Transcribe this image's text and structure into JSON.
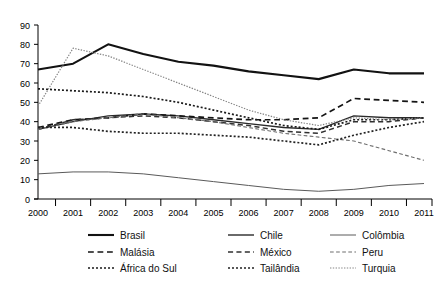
{
  "chart_data": {
    "type": "line",
    "title": "",
    "xlabel": "",
    "ylabel": "",
    "x": [
      2000,
      2001,
      2002,
      2003,
      2004,
      2005,
      2006,
      2007,
      2008,
      2009,
      2010,
      2011
    ],
    "categories": [
      "2000",
      "2001",
      "2002",
      "2003",
      "2004",
      "2005",
      "2006",
      "2007",
      "2008",
      "2009",
      "2010",
      "2011"
    ],
    "ylim": [
      0,
      90
    ],
    "yticks": [
      0,
      10,
      20,
      30,
      40,
      50,
      60,
      70,
      80,
      90
    ],
    "ytick_labels": [
      "0",
      "10",
      "20",
      "30",
      "40",
      "50",
      "60",
      "70",
      "80",
      "90"
    ],
    "grid": false,
    "legend_position": "bottom",
    "series": [
      {
        "name": "Brasil",
        "style": "solid",
        "width": 2.1,
        "color": "#121212",
        "values": [
          67,
          70,
          80,
          75,
          71,
          69,
          66,
          64,
          62,
          67,
          65,
          65
        ]
      },
      {
        "name": "Chile",
        "style": "solid",
        "width": 1.4,
        "color": "#2a2a2a",
        "values": [
          36,
          40,
          43,
          44,
          43,
          41,
          39,
          37,
          36,
          43,
          42,
          42
        ]
      },
      {
        "name": "Colômbia",
        "style": "solid",
        "width": 1.0,
        "color": "#5a5a5a",
        "values": [
          13,
          14,
          14,
          13,
          11,
          9,
          7,
          5,
          4,
          5,
          7,
          8
        ]
      },
      {
        "name": "Malásia",
        "style": "dashed",
        "width": 1.7,
        "color": "#141414",
        "values": [
          37,
          41,
          42,
          44,
          43,
          42,
          41,
          41,
          42,
          52,
          51,
          50
        ]
      },
      {
        "name": "México",
        "style": "dashed",
        "width": 1.5,
        "color": "#303030",
        "values": [
          36,
          41,
          42,
          43,
          42,
          40,
          38,
          35,
          34,
          40,
          40,
          42
        ]
      },
      {
        "name": "Peru",
        "style": "dashed",
        "width": 1.1,
        "color": "#6e6e6e",
        "values": [
          36,
          40,
          42,
          44,
          42,
          40,
          37,
          34,
          32,
          30,
          25,
          20
        ]
      },
      {
        "name": "África do Sul",
        "style": "dotted",
        "width": 1.7,
        "color": "#1a1a1a",
        "values": [
          57,
          56,
          55,
          53,
          50,
          46,
          42,
          38,
          36,
          41,
          41,
          42
        ]
      },
      {
        "name": "Tailândia",
        "style": "dotted",
        "width": 1.7,
        "color": "#222222",
        "values": [
          37,
          37,
          35,
          34,
          34,
          33,
          32,
          30,
          28,
          33,
          37,
          40
        ]
      },
      {
        "name": "Turquia",
        "style": "dotted",
        "width": 1.2,
        "color": "#858585",
        "values": [
          48,
          78,
          74,
          67,
          60,
          53,
          46,
          41,
          38,
          42,
          41,
          42
        ]
      }
    ]
  },
  "axis": {
    "y_labels": [
      "90",
      "80",
      "70",
      "60",
      "50",
      "40",
      "30",
      "20",
      "10",
      "0"
    ],
    "x_labels": [
      "2000",
      "2001",
      "2002",
      "2003",
      "2004",
      "2005",
      "2006",
      "2007",
      "2008",
      "2009",
      "2010",
      "2011"
    ]
  },
  "legend": {
    "rows": [
      [
        {
          "label": "Brasil",
          "style": "solid",
          "width": 2.1,
          "color": "#121212"
        },
        {
          "label": "Chile",
          "style": "solid",
          "width": 1.4,
          "color": "#2a2a2a"
        },
        {
          "label": "Colômbia",
          "style": "solid",
          "width": 1.0,
          "color": "#5a5a5a"
        }
      ],
      [
        {
          "label": "Malásia",
          "style": "dashed",
          "width": 1.7,
          "color": "#141414"
        },
        {
          "label": "México",
          "style": "dashed",
          "width": 1.5,
          "color": "#303030"
        },
        {
          "label": "Peru",
          "style": "dashed",
          "width": 1.1,
          "color": "#6e6e6e"
        }
      ],
      [
        {
          "label": "África do Sul",
          "style": "dotted",
          "width": 1.7,
          "color": "#1a1a1a"
        },
        {
          "label": "Tailândia",
          "style": "dotted",
          "width": 1.7,
          "color": "#222222"
        },
        {
          "label": "Turquia",
          "style": "dotted",
          "width": 1.2,
          "color": "#858585"
        }
      ]
    ]
  }
}
